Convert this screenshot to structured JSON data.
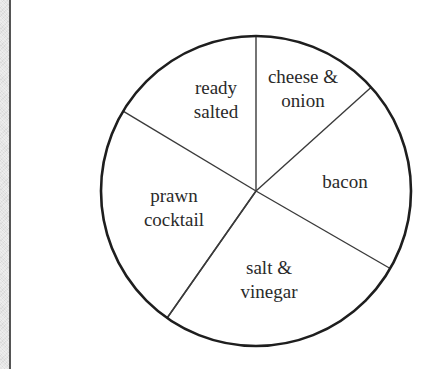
{
  "chart_data": {
    "type": "pie",
    "title": "",
    "xlabel": "",
    "ylabel": "",
    "legend": "none (labels drawn inside slices)",
    "center": [
      256,
      191
    ],
    "radius": 155,
    "slices": [
      {
        "label": "cheese & onion",
        "lines": [
          "cheese &",
          "onion"
        ],
        "start_angle_deg": 42,
        "end_angle_deg": 90,
        "degrees": 48,
        "label_pos": [
          303,
          83
        ]
      },
      {
        "label": "bacon",
        "lines": [
          "bacon"
        ],
        "start_angle_deg": -30,
        "end_angle_deg": 42,
        "degrees": 72,
        "label_pos": [
          345,
          188
        ]
      },
      {
        "label": "salt & vinegar",
        "lines": [
          "salt &",
          "vinegar"
        ],
        "start_angle_deg": -125,
        "end_angle_deg": -30,
        "degrees": 95,
        "label_pos": [
          268,
          274
        ]
      },
      {
        "label": "prawn cocktail",
        "lines": [
          "prawn",
          "cocktail"
        ],
        "start_angle_deg": 149,
        "end_angle_deg": 235,
        "degrees": 86,
        "label_pos": [
          174,
          202
        ]
      },
      {
        "label": "ready salted",
        "lines": [
          "ready",
          "salted"
        ],
        "start_angle_deg": 90,
        "end_angle_deg": 149,
        "degrees": 59,
        "label_pos": [
          216,
          94
        ]
      }
    ],
    "categories": [
      "cheese & onion",
      "bacon",
      "salt & vinegar",
      "prawn cocktail",
      "ready salted"
    ],
    "values": [
      48,
      72,
      95,
      86,
      59
    ],
    "units": "degrees",
    "colors": {
      "outline": "#1e1e1e",
      "spokes": "#3a3a3a",
      "fill": "#ffffff",
      "text": "#2a2a2a"
    }
  },
  "labels": {
    "cheese_onion_l1": "cheese &",
    "cheese_onion_l2": "onion",
    "bacon_l1": "bacon",
    "salt_vinegar_l1": "salt &",
    "salt_vinegar_l2": "vinegar",
    "prawn_cocktail_l1": "prawn",
    "prawn_cocktail_l2": "cocktail",
    "ready_salted_l1": "ready",
    "ready_salted_l2": "salted"
  }
}
